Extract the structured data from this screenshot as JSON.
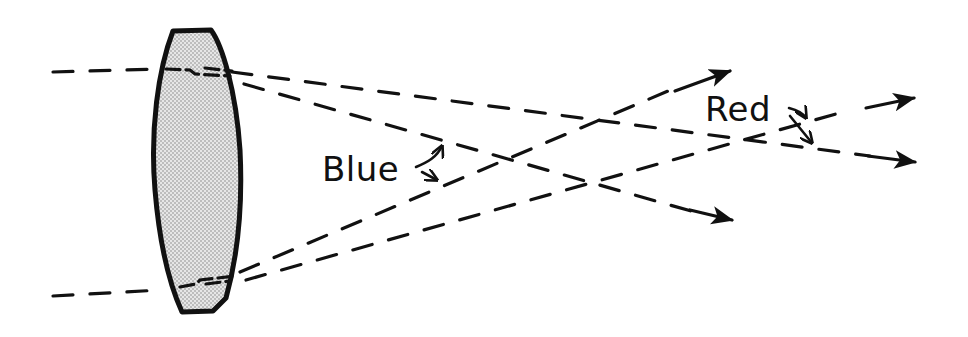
{
  "diagram": {
    "labels": {
      "blue": "Blue",
      "red": "Red"
    },
    "colors": {
      "ink": "#111111",
      "lens_fill": "#d9d9d9",
      "background": "#ffffff"
    },
    "elements": {
      "lens": "biconvex-lens",
      "incoming_rays": 2,
      "blue_focus": "near focal point (closer to lens)",
      "red_focus": "far focal point (farther from lens)"
    }
  }
}
